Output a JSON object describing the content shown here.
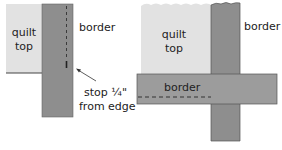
{
  "colors": {
    "quilt_top": "#e2e2e2",
    "border_fabric": "#8e8e8e",
    "border_fabric_light": "#9c9c9c",
    "outline": "#333333",
    "text": "#222222"
  },
  "left_diagram": {
    "quilt_label_line1": "quilt",
    "quilt_label_line2": "top",
    "border_label": "border",
    "note_line1": "stop ¼\"",
    "note_line2": "from edge"
  },
  "right_diagram": {
    "quilt_label_line1": "quilt",
    "quilt_label_line2": "top",
    "vertical_border_label": "border",
    "horizontal_border_label": "border"
  }
}
